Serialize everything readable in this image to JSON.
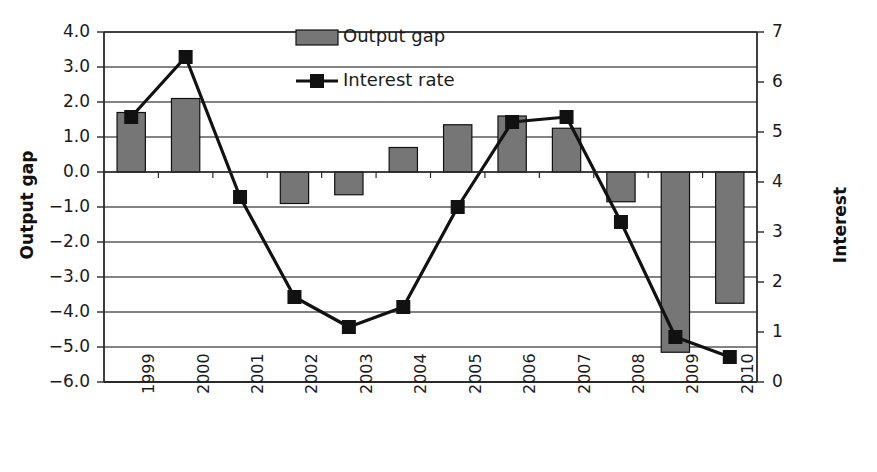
{
  "chart_data": {
    "type": "bar",
    "title": "",
    "xlabel": "",
    "ylabel": "Output gap",
    "ylabel_right": "Interest",
    "categories": [
      "1999",
      "2000",
      "2001",
      "2002",
      "2003",
      "2004",
      "2005",
      "2006",
      "2007",
      "2008",
      "2009",
      "2010"
    ],
    "series": [
      {
        "name": "Output gap",
        "type": "bar",
        "axis": "left",
        "color": "#767676",
        "values": [
          1.7,
          2.1,
          0.0,
          -0.9,
          -0.65,
          0.7,
          1.35,
          1.6,
          1.25,
          -0.85,
          -5.15,
          -3.75
        ]
      },
      {
        "name": "Interest rate",
        "type": "line",
        "axis": "right",
        "color": "#111111",
        "marker": "square",
        "values": [
          5.3,
          6.5,
          3.7,
          1.7,
          1.1,
          1.5,
          3.5,
          5.2,
          5.3,
          3.2,
          0.9,
          0.5
        ]
      }
    ],
    "ylim": [
      -6.0,
      4.0
    ],
    "ylim_right": [
      0,
      7
    ],
    "yticks_left": [
      "4.0",
      "3.0",
      "2.0",
      "1.0",
      "0.0",
      "-1.0",
      "-2.0",
      "-3.0",
      "-4.0",
      "-5.0",
      "-6.0"
    ],
    "yticks_right": [
      "7",
      "6",
      "5",
      "4",
      "3",
      "2",
      "1",
      "0"
    ],
    "grid": true,
    "legend_position": "top-center",
    "legend": [
      {
        "label": "Output gap",
        "marker": "bar-swatch",
        "color": "#767676"
      },
      {
        "label": "Interest rate",
        "marker": "line-square",
        "color": "#111111"
      }
    ]
  }
}
